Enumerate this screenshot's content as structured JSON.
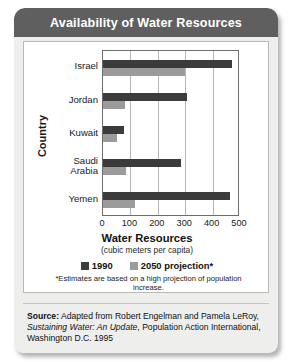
{
  "header": {
    "title": "Availability of Water Resources"
  },
  "chart_data": {
    "type": "bar",
    "orientation": "horizontal",
    "title": "Availability of Water Resources",
    "xlabel": "Water Resources",
    "xlabel_sub": "(cubic meters per capita)",
    "ylabel": "Country",
    "categories": [
      "Israel",
      "Jordan",
      "Kuwait",
      "Saudi Arabia",
      "Yemen"
    ],
    "category_lines": [
      [
        "Israel"
      ],
      [
        "Jordan"
      ],
      [
        "Kuwait"
      ],
      [
        "Saudi",
        "Arabia"
      ],
      [
        "Yemen"
      ]
    ],
    "series": [
      {
        "name": "1990",
        "color": "#3b3b3b",
        "values": [
          470,
          308,
          75,
          285,
          465
        ]
      },
      {
        "name": "2050 projection*",
        "color": "#9b9b9b",
        "values": [
          300,
          80,
          50,
          85,
          115
        ]
      }
    ],
    "xlim": [
      0,
      500
    ],
    "xticks": [
      0,
      100,
      200,
      300,
      400,
      500
    ],
    "xtick_labels": [
      "0",
      "100",
      "200",
      "300",
      "400",
      "500"
    ],
    "grid": "vertical",
    "legend_position": "below-axis"
  },
  "footnote": "*Estimates are based on a high projection of population increase.",
  "source": {
    "label": "Source:",
    "part1": " Adapted from Robert Engelman and Pamela LeRoy, ",
    "italic": "Sustaining Water: An Update",
    "part2": ", Population Action International, Washington D.C. 1995"
  }
}
